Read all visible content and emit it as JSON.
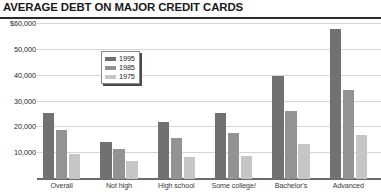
{
  "chart_data": {
    "type": "bar",
    "title": "AVERAGE DEBT ON MAJOR CREDIT CARDS",
    "xlabel": "",
    "ylabel": "",
    "ylim": [
      0,
      60000
    ],
    "yticks": [
      60000,
      50000,
      40000,
      30000,
      20000,
      10000
    ],
    "ytick_labels": [
      "$60,000",
      "50,000",
      "40,000",
      "30,000",
      "20,000",
      "10,000"
    ],
    "grid": true,
    "legend_position": "inside-upper-left",
    "categories": [
      "Overall",
      "Not high",
      "High school",
      "Some college/",
      "Bachelor's",
      "Advanced"
    ],
    "series": [
      {
        "name": "1995",
        "color": "#717171",
        "values": [
          25500,
          14500,
          22000,
          25500,
          40000,
          58000
        ]
      },
      {
        "name": "1985",
        "color": "#939393",
        "values": [
          19000,
          11500,
          16000,
          18000,
          26500,
          34500
        ]
      },
      {
        "name": "1975",
        "color": "#c6c6c6",
        "values": [
          9500,
          7000,
          8500,
          9000,
          13500,
          17000
        ]
      }
    ]
  }
}
